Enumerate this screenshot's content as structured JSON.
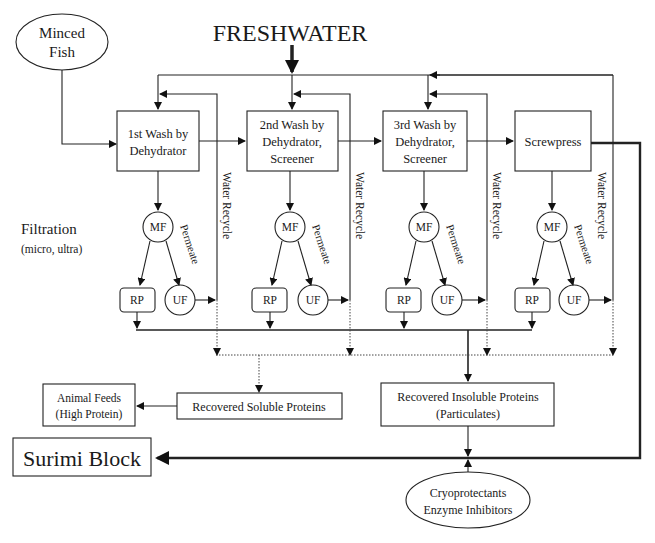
{
  "diagram": {
    "source": {
      "line1": "Minced",
      "line2": "Fish"
    },
    "input": "FRESHWATER",
    "stages": [
      {
        "line1": "1st Wash by",
        "line2": "Dehydrator",
        "line3": ""
      },
      {
        "line1": "2nd Wash by",
        "line2": "Dehydrator,",
        "line3": "Screener"
      },
      {
        "line1": "3rd Wash by",
        "line2": "Dehydrator,",
        "line3": "Screener"
      },
      {
        "line1": "Screwpress",
        "line2": "",
        "line3": ""
      }
    ],
    "filtration": {
      "title": "Filtration",
      "subtitle": "(micro, ultra)"
    },
    "filter_units": {
      "mf": "MF",
      "rp": "RP",
      "uf": "UF",
      "permeate": "Permeate"
    },
    "recycle_label": "Water Recycle",
    "outputs": {
      "soluble": "Recovered Soluble Proteins",
      "animal_feeds": {
        "line1": "Animal Feeds",
        "line2": "(High Protein)"
      },
      "insoluble": {
        "line1": "Recovered Insoluble Proteins",
        "line2": "(Particulates)"
      },
      "surimi": "Surimi Block",
      "additives": {
        "line1": "Cryoprotectants",
        "line2": "Enzyme Inhibitors"
      }
    }
  }
}
